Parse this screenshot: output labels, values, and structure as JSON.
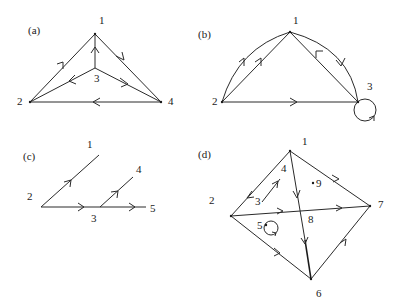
{
  "figure": {
    "panels": [
      {
        "id": "a",
        "label": "(a)",
        "nodes": [
          {
            "id": "1",
            "label": "1"
          },
          {
            "id": "2",
            "label": "2"
          },
          {
            "id": "3",
            "label": "3"
          },
          {
            "id": "4",
            "label": "4"
          }
        ],
        "edges": [
          {
            "from": "2",
            "to": "1",
            "directed": true
          },
          {
            "from": "1",
            "to": "4",
            "directed": true
          },
          {
            "from": "3",
            "to": "1",
            "directed": true
          },
          {
            "from": "3",
            "to": "2",
            "directed": true
          },
          {
            "from": "3",
            "to": "4",
            "directed": true
          },
          {
            "from": "4",
            "to": "2",
            "directed": true
          }
        ]
      },
      {
        "id": "b",
        "label": "(b)",
        "nodes": [
          {
            "id": "1",
            "label": "1"
          },
          {
            "id": "2",
            "label": "2"
          },
          {
            "id": "3",
            "label": "3"
          }
        ],
        "edges": [
          {
            "from": "2",
            "to": "1",
            "directed": true,
            "shape": "arc"
          },
          {
            "from": "2",
            "to": "1",
            "directed": true,
            "shape": "straight"
          },
          {
            "from": "3",
            "to": "1",
            "directed": true,
            "shape": "straight"
          },
          {
            "from": "1",
            "to": "3",
            "directed": true,
            "shape": "arc"
          },
          {
            "from": "2",
            "to": "3",
            "directed": true,
            "shape": "straight"
          },
          {
            "from": "3",
            "to": "3",
            "directed": true,
            "shape": "loop"
          }
        ]
      },
      {
        "id": "c",
        "label": "(c)",
        "nodes": [
          {
            "id": "1",
            "label": "1"
          },
          {
            "id": "2",
            "label": "2"
          },
          {
            "id": "3",
            "label": "3"
          },
          {
            "id": "4",
            "label": "4"
          },
          {
            "id": "5",
            "label": "5"
          }
        ],
        "edges": [
          {
            "from": "2",
            "to": "1",
            "directed": true
          },
          {
            "from": "2",
            "to": "3",
            "directed": true
          },
          {
            "from": "3",
            "to": "4",
            "directed": true
          },
          {
            "from": "3",
            "to": "5",
            "directed": true
          }
        ]
      },
      {
        "id": "d",
        "label": "(d)",
        "nodes": [
          {
            "id": "1",
            "label": "1"
          },
          {
            "id": "2",
            "label": "2"
          },
          {
            "id": "3",
            "label": "3"
          },
          {
            "id": "4",
            "label": "4"
          },
          {
            "id": "5",
            "label": "5"
          },
          {
            "id": "6",
            "label": "6"
          },
          {
            "id": "7",
            "label": "7"
          },
          {
            "id": "8",
            "label": "8"
          },
          {
            "id": "9",
            "label": "9"
          }
        ],
        "edges": [
          {
            "from": "1",
            "to": "2",
            "directed": true
          },
          {
            "from": "3",
            "to": "4",
            "directed": true
          },
          {
            "from": "1",
            "to": "7",
            "directed": true
          },
          {
            "from": "2",
            "to": "7",
            "directed": true
          },
          {
            "from": "1",
            "to": "6",
            "directed": true
          },
          {
            "from": "2",
            "to": "6",
            "directed": true
          },
          {
            "from": "6",
            "to": "7",
            "directed": true
          },
          {
            "from": "5",
            "to": "5",
            "directed": true,
            "shape": "loop"
          }
        ],
        "isolated_nodes": [
          "9"
        ]
      }
    ]
  }
}
